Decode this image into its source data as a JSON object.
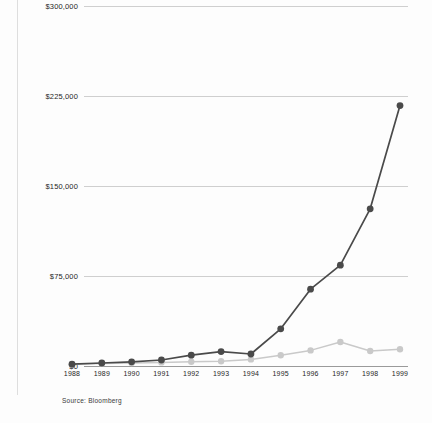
{
  "source_note": "Source: Bloomberg",
  "colors": {
    "series_primary": "#4a4a4a",
    "series_secondary": "#c9c9c9",
    "gridline": "#cfcfcf",
    "baseline": "#9a9a9a",
    "text": "#1f1f1f",
    "background": "#fdfdfd"
  },
  "chart_data": {
    "type": "line",
    "title": "",
    "subtitle": "",
    "xlabel": "",
    "ylabel": "",
    "grid": true,
    "legend": "none",
    "ylim": [
      0,
      300000
    ],
    "yticks": [
      0,
      75000,
      150000,
      225000,
      300000
    ],
    "ytick_labels": [
      "$0",
      "$75,000",
      "$150,000",
      "$225,000",
      "$300,000"
    ],
    "categories": [
      "1988",
      "1989",
      "1990",
      "1991",
      "1992",
      "1993",
      "1994",
      "1995",
      "1996",
      "1997",
      "1998",
      "1999"
    ],
    "series": [
      {
        "name": "primary",
        "color": "#4a4a4a",
        "values": [
          1500,
          2500,
          3500,
          5000,
          9000,
          12000,
          10000,
          31000,
          64000,
          84000,
          131000,
          217000
        ]
      },
      {
        "name": "secondary",
        "color": "#c9c9c9",
        "values": [
          1500,
          2000,
          2500,
          3000,
          3500,
          4000,
          5500,
          9000,
          13000,
          20000,
          12500,
          14000
        ]
      }
    ],
    "annotations": [
      {
        "text": "Source: Bloomberg"
      }
    ]
  }
}
